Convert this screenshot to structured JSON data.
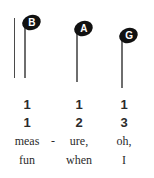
{
  "figure": {
    "kind": "music-notation-excerpt",
    "barline": {
      "visible": true
    },
    "notes": [
      {
        "letter": "B",
        "duration": "quarter",
        "stem": "down"
      },
      {
        "letter": "A",
        "duration": "quarter",
        "stem": "down"
      },
      {
        "letter": "G",
        "duration": "quarter",
        "stem": "down"
      }
    ],
    "counts_row": [
      "1",
      "1",
      "1"
    ],
    "beats_row": [
      "1",
      "2",
      "3"
    ],
    "lyrics_verse1": [
      "meas",
      "ure,",
      "oh,"
    ],
    "lyrics_verse1_hyphen": "-",
    "lyrics_verse2": [
      "fun",
      "when",
      "I"
    ],
    "colors": {
      "notehead": "#111111",
      "stem": "#6e6e6e",
      "barline": "#4a4a4a",
      "text": "#2b2b2b",
      "notehead_letter": "#ffffff",
      "background": "#ffffff"
    }
  }
}
